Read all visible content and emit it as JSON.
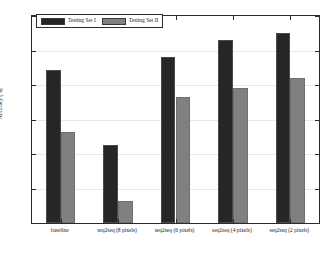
{
  "chart_data": {
    "type": "bar",
    "title": "",
    "xlabel": "",
    "ylabel": "Accuracy (%)",
    "ylim": [
      60,
      90
    ],
    "yticks": [
      60,
      65,
      70,
      75,
      80,
      85,
      90
    ],
    "grid": true,
    "legend_position": "top-left",
    "categories": [
      "baseline",
      "seq2seq (8 pixels)",
      "seq2seq (6 pixels)",
      "seq2seq (4 pixels)",
      "seq2seq (2 pixels)"
    ],
    "series": [
      {
        "name": "Testing Set I",
        "color": "#262626",
        "values": [
          82.2,
          71.3,
          84.1,
          86.5,
          87.6
        ]
      },
      {
        "name": "Testing Set II",
        "color": "#808080",
        "values": [
          73.2,
          63.2,
          78.2,
          79.5,
          81.0
        ]
      }
    ]
  },
  "figure": {
    "background": "#ffffff",
    "axis_color": "#2b2b2b",
    "grid_color": "#e8e8e8"
  }
}
